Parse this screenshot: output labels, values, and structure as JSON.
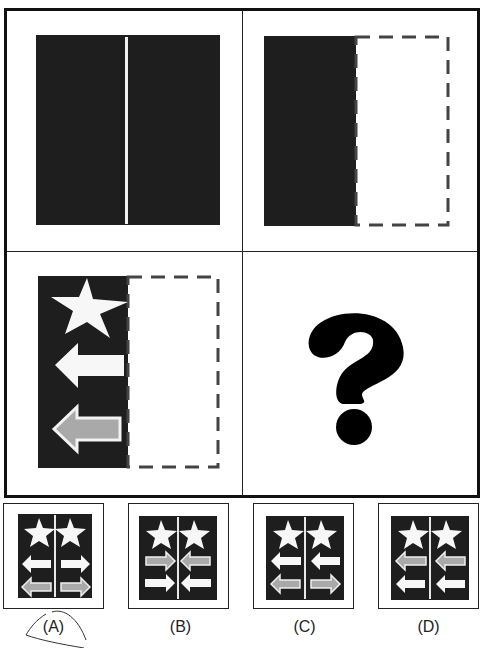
{
  "puzzle": {
    "type": "visual-matrix-completion",
    "cells": [
      {
        "position": "top-left",
        "description": "dark square with white vertical center line"
      },
      {
        "position": "top-right",
        "description": "left half dark, right half dashed outline"
      },
      {
        "position": "bottom-left",
        "description": "left half dark with star, white left arrow, gray left arrow; right half dashed outline"
      },
      {
        "position": "bottom-right",
        "description": "missing",
        "symbol": "?"
      }
    ],
    "question_mark": "?"
  },
  "options": [
    {
      "label": "(A)",
      "left": [
        "star",
        "white-arrow-left",
        "gray-arrow-left"
      ],
      "right": [
        "star",
        "white-arrow-right",
        "gray-arrow-right"
      ]
    },
    {
      "label": "(B)",
      "left": [
        "star",
        "gray-arrow-right",
        "white-arrow-right"
      ],
      "right": [
        "star",
        "gray-arrow-left",
        "white-arrow-left"
      ]
    },
    {
      "label": "(C)",
      "left": [
        "star",
        "white-arrow-left",
        "gray-arrow-left"
      ],
      "right": [
        "star",
        "white-arrow-left",
        "gray-arrow-right"
      ]
    },
    {
      "label": "(D)",
      "left": [
        "star",
        "gray-arrow-left",
        "white-arrow-left"
      ],
      "right": [
        "star",
        "gray-arrow-left",
        "white-arrow-left"
      ]
    }
  ],
  "colors": {
    "dark": "#1e1e1e",
    "white_shape": "#f7f7f7",
    "gray_shape": "#a9a9a9",
    "dash": "#444444",
    "frame": "#111111"
  }
}
